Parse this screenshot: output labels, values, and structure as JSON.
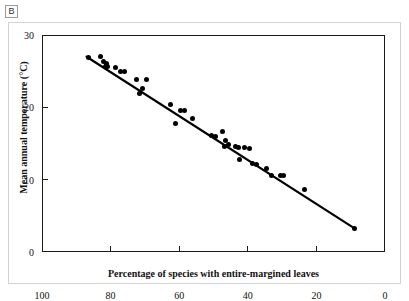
{
  "panel": {
    "label": "B"
  },
  "chart_data": {
    "type": "scatter",
    "title": "",
    "xlabel": "Percentage of species with entire-margined leaves",
    "ylabel": "Mean annual temperature (°C)",
    "xlim": [
      100,
      0
    ],
    "ylim": [
      0,
      30
    ],
    "x_reversed": true,
    "grid": false,
    "legend": null,
    "xticks": [
      100,
      80,
      60,
      40,
      20,
      0
    ],
    "yticks": [
      0,
      10,
      20,
      30
    ],
    "xtick_labels": [
      "100",
      "80",
      "60",
      "40",
      "20",
      "0"
    ],
    "ytick_labels": [
      "0",
      "10",
      "20",
      "30"
    ],
    "points": [
      {
        "x": 86.5,
        "y": 26.9
      },
      {
        "x": 83.0,
        "y": 27.0
      },
      {
        "x": 82.0,
        "y": 26.3
      },
      {
        "x": 81.6,
        "y": 25.7
      },
      {
        "x": 81.3,
        "y": 26.0
      },
      {
        "x": 81.0,
        "y": 25.6
      },
      {
        "x": 78.5,
        "y": 25.5
      },
      {
        "x": 77.0,
        "y": 24.9
      },
      {
        "x": 76.0,
        "y": 25.0
      },
      {
        "x": 72.5,
        "y": 23.8
      },
      {
        "x": 71.5,
        "y": 21.9
      },
      {
        "x": 70.8,
        "y": 22.6
      },
      {
        "x": 69.5,
        "y": 23.8
      },
      {
        "x": 62.5,
        "y": 20.4
      },
      {
        "x": 59.5,
        "y": 19.6
      },
      {
        "x": 58.5,
        "y": 19.5
      },
      {
        "x": 61.0,
        "y": 17.7
      },
      {
        "x": 56.0,
        "y": 18.5
      },
      {
        "x": 50.5,
        "y": 16.1
      },
      {
        "x": 49.5,
        "y": 15.9
      },
      {
        "x": 47.5,
        "y": 16.6
      },
      {
        "x": 46.5,
        "y": 15.4
      },
      {
        "x": 46.8,
        "y": 14.6
      },
      {
        "x": 45.5,
        "y": 14.8
      },
      {
        "x": 43.5,
        "y": 14.6
      },
      {
        "x": 42.8,
        "y": 14.4
      },
      {
        "x": 41.0,
        "y": 14.5
      },
      {
        "x": 39.5,
        "y": 14.3
      },
      {
        "x": 42.5,
        "y": 12.8
      },
      {
        "x": 38.5,
        "y": 12.2
      },
      {
        "x": 37.5,
        "y": 12.1
      },
      {
        "x": 34.5,
        "y": 11.5
      },
      {
        "x": 33.0,
        "y": 10.6
      },
      {
        "x": 30.5,
        "y": 10.6
      },
      {
        "x": 29.5,
        "y": 10.6
      },
      {
        "x": 23.5,
        "y": 8.6
      },
      {
        "x": 9.0,
        "y": 3.3
      }
    ],
    "trendline": {
      "type": "linear-fit",
      "x_start": 87.0,
      "y_start": 27.0,
      "x_end": 9.0,
      "y_end": 3.3
    }
  }
}
